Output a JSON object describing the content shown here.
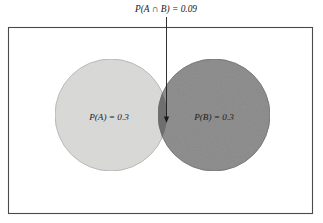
{
  "figure": {
    "type": "venn-diagram",
    "background_color": "#ffffff"
  },
  "sample_space": {
    "name": "sample-space-rectangle",
    "fill": "#ffffff",
    "border_color": "#4a4a4a",
    "x": 8,
    "y": 27,
    "width": 305,
    "height": 187
  },
  "sets": {
    "A": {
      "label": "P(A) = 0.3",
      "probability": 0.3,
      "fill": "#d9d9d7",
      "stroke": "#b3b3b1",
      "cx": 111,
      "cy": 115,
      "r": 56,
      "label_x": 109,
      "label_y": 118
    },
    "B": {
      "label": "P(B) = 0.3",
      "probability": 0.3,
      "fill": "#8a8a8a",
      "stroke": "#6f6f6f",
      "cx": 214,
      "cy": 115,
      "r": 56,
      "label_x": 214,
      "label_y": 118
    }
  },
  "intersection": {
    "label": "P(A ∩ B) = 0.09",
    "probability": 0.09,
    "fill": "#6e6e6e",
    "label_x": 166,
    "label_y": 10,
    "arrow": {
      "name": "pointer-arrow",
      "color": "#1a1a1a",
      "x": 166.5,
      "y_start": 17,
      "y_end": 122
    }
  },
  "chart_data": {
    "type": "venn",
    "title": "",
    "sets": [
      {
        "name": "A",
        "label": "P(A) = 0.3",
        "value": 0.3
      },
      {
        "name": "B",
        "label": "P(B) = 0.3",
        "value": 0.3
      }
    ],
    "intersections": [
      {
        "sets": [
          "A",
          "B"
        ],
        "label": "P(A ∩ B) = 0.09",
        "value": 0.09
      }
    ],
    "annotations": [
      {
        "text": "P(A ∩ B) = 0.09",
        "points_to": "intersection of A and B"
      }
    ],
    "legend": "none",
    "grid": false
  }
}
